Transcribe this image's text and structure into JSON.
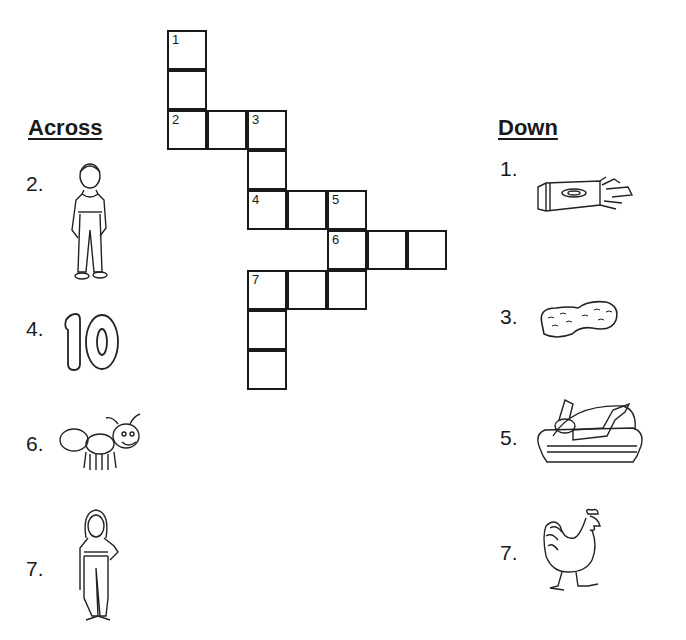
{
  "headings": {
    "across": "Across",
    "down": "Down"
  },
  "grid": {
    "origin": [
      167,
      30
    ],
    "cell_size": 40,
    "cells": [
      {
        "row": 0,
        "col": 0,
        "num": "1"
      },
      {
        "row": 1,
        "col": 0,
        "num": ""
      },
      {
        "row": 2,
        "col": 0,
        "num": "2"
      },
      {
        "row": 2,
        "col": 1,
        "num": ""
      },
      {
        "row": 2,
        "col": 2,
        "num": "3"
      },
      {
        "row": 3,
        "col": 2,
        "num": ""
      },
      {
        "row": 4,
        "col": 2,
        "num": "4"
      },
      {
        "row": 4,
        "col": 3,
        "num": ""
      },
      {
        "row": 4,
        "col": 4,
        "num": "5"
      },
      {
        "row": 5,
        "col": 4,
        "num": "6"
      },
      {
        "row": 5,
        "col": 5,
        "num": ""
      },
      {
        "row": 5,
        "col": 6,
        "num": ""
      },
      {
        "row": 6,
        "col": 2,
        "num": "7"
      },
      {
        "row": 6,
        "col": 3,
        "num": ""
      },
      {
        "row": 6,
        "col": 4,
        "num": ""
      },
      {
        "row": 7,
        "col": 2,
        "num": ""
      },
      {
        "row": 8,
        "col": 2,
        "num": ""
      }
    ]
  },
  "across": [
    {
      "label": "2.",
      "picture": "man-icon"
    },
    {
      "label": "4.",
      "picture": "number-ten-icon"
    },
    {
      "label": "6.",
      "picture": "ant-icon"
    },
    {
      "label": "7.",
      "picture": "woman-icon"
    }
  ],
  "down": [
    {
      "label": "1.",
      "picture": "crayon-box-icon"
    },
    {
      "label": "3.",
      "picture": "peanut-icon"
    },
    {
      "label": "5.",
      "picture": "man-on-sofa-icon"
    },
    {
      "label": "7.",
      "picture": "rooster-icon"
    }
  ]
}
